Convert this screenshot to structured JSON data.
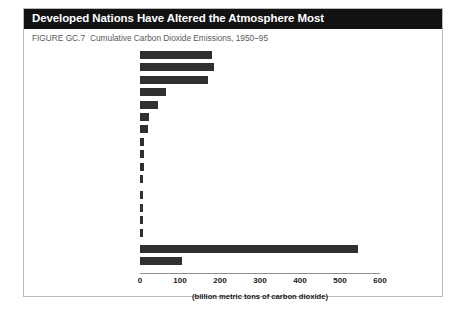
{
  "figure": {
    "title": "Developed Nations Have Altered the Atmosphere Most",
    "figure_number": "FIGURE GC.7",
    "caption": "Cumulative Carbon Dioxide Emissions, 1950–95"
  },
  "colors": {
    "title_bar_background": "#121212",
    "title_text": "#ffffff",
    "bar_fill": "#303030",
    "axis_line": "#8d8d8d",
    "frame_border": "#b9b9b9",
    "caption_text": "#5a5a5a"
  },
  "chart_data": {
    "type": "bar",
    "orientation": "horizontal",
    "title": "Developed Nations Have Altered the Atmosphere Most",
    "subtitle": "FIGURE GC.7  Cumulative Carbon Dioxide Emissions, 1950–95",
    "xlabel": "(billion metric tons of carbon dioxide)",
    "ylabel": "",
    "xlim": [
      0,
      600
    ],
    "xticks": [
      0,
      100,
      200,
      300,
      400,
      500,
      600
    ],
    "xticklabels": [
      "0",
      "100",
      "200",
      "300",
      "400",
      "500",
      "600"
    ],
    "grid": false,
    "legend": null,
    "categories": [
      "United States",
      "European Union",
      "Former USSR",
      "China",
      "Japan",
      "India",
      "Canada",
      "South Africa",
      "Mexico",
      "Australia",
      "Spain",
      "Brazil",
      "Iran, Islamic Rep",
      "Korea, Dem People's Rep",
      "Korea, Rep",
      "Developed Countries",
      "Developing Countries"
    ],
    "values": [
      181,
      186,
      171,
      65,
      45,
      22,
      20,
      11,
      10,
      10,
      8,
      8,
      7,
      7,
      7,
      545,
      105
    ],
    "units": "billion metric tons of carbon dioxide"
  }
}
